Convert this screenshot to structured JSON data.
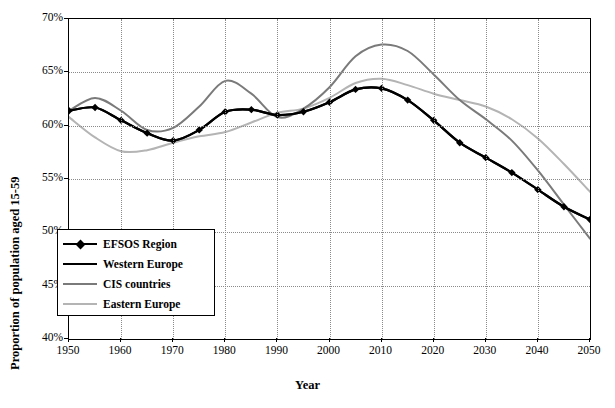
{
  "chart_data": {
    "type": "line",
    "title": "",
    "xlabel": "Year",
    "ylabel": "Proportion of population aged 15-59",
    "xlim": [
      1950,
      2050
    ],
    "ylim": [
      40,
      70
    ],
    "xticks": [
      "1950",
      "1960",
      "1970",
      "1980",
      "1990",
      "2000",
      "2010",
      "2020",
      "2030",
      "2040",
      "2050"
    ],
    "yticks": [
      "40%",
      "45%",
      "50%",
      "55%",
      "60%",
      "65%",
      "70%"
    ],
    "grid": true,
    "legend_position": "lower-left-inside",
    "x": [
      1950,
      1955,
      1960,
      1965,
      1970,
      1975,
      1980,
      1985,
      1990,
      1995,
      2000,
      2005,
      2010,
      2015,
      2020,
      2025,
      2030,
      2035,
      2040,
      2045,
      2050
    ],
    "series": [
      {
        "name": "EFSOS Region",
        "color": "#000000",
        "marker": "diamond",
        "width": 2.2,
        "values": [
          61.4,
          61.7,
          60.5,
          59.3,
          58.6,
          59.6,
          61.3,
          61.5,
          61.0,
          61.3,
          62.2,
          63.4,
          63.5,
          62.4,
          60.5,
          58.4,
          57.0,
          55.6,
          54.0,
          52.4,
          51.2
        ]
      },
      {
        "name": "Western Europe",
        "color": "#000000",
        "marker": "none",
        "width": 2.2,
        "values": [
          61.4,
          61.7,
          60.5,
          59.3,
          58.6,
          59.6,
          61.3,
          61.5,
          61.0,
          61.3,
          62.2,
          63.4,
          63.5,
          62.4,
          60.5,
          58.4,
          57.0,
          55.6,
          54.0,
          52.4,
          51.2
        ]
      },
      {
        "name": "CIS countries",
        "color": "#7a7a7a",
        "marker": "none",
        "width": 2.0,
        "values": [
          61.4,
          62.6,
          61.4,
          59.6,
          59.8,
          61.8,
          64.2,
          63.0,
          60.8,
          61.6,
          63.6,
          66.5,
          67.6,
          67.0,
          64.8,
          62.4,
          60.6,
          58.6,
          55.8,
          52.6,
          49.4
        ]
      },
      {
        "name": "Eastern Europe",
        "color": "#b4b4b4",
        "marker": "none",
        "width": 2.0,
        "values": [
          60.8,
          58.9,
          57.6,
          57.7,
          58.4,
          59.0,
          59.4,
          60.3,
          61.2,
          61.6,
          62.6,
          64.0,
          64.4,
          63.8,
          63.0,
          62.4,
          61.8,
          60.6,
          58.8,
          56.4,
          53.8
        ]
      }
    ]
  },
  "legend": {
    "items": [
      {
        "label": "EFSOS Region"
      },
      {
        "label": "Western Europe"
      },
      {
        "label": "CIS countries"
      },
      {
        "label": "Eastern Europe"
      }
    ]
  }
}
